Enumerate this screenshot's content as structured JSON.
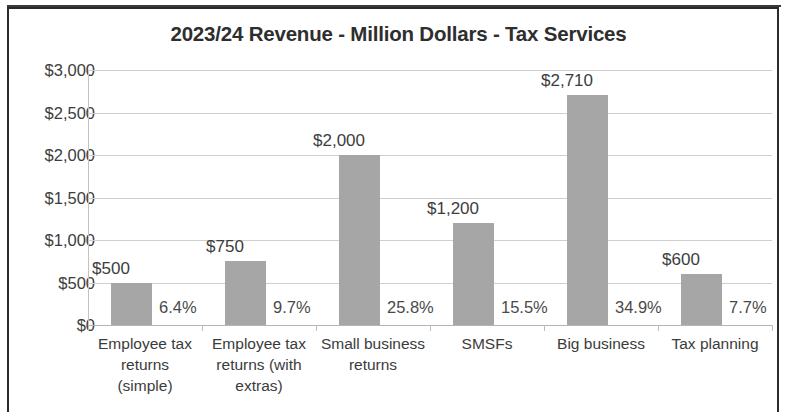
{
  "chart_data": {
    "type": "bar",
    "title": "2023/24 Revenue - Million Dollars - Tax Services",
    "xlabel": "",
    "ylabel": "",
    "ylim": [
      0,
      3000
    ],
    "ytick_labels": [
      "$3,000",
      "$2,500",
      "$2,000",
      "$1,500",
      "$1,000",
      "$500",
      "$0"
    ],
    "ytick_values": [
      3000,
      2500,
      2000,
      1500,
      1000,
      500,
      0
    ],
    "grid": true,
    "legend": "none",
    "bar_color": "#a6a6a6",
    "categories": [
      "Employee tax returns (simple)",
      "Employee tax returns (with extras)",
      "Small business returns",
      "SMSFs",
      "Big business",
      "Tax planning"
    ],
    "category_lines": [
      [
        "Employee tax",
        "returns",
        "(simple)"
      ],
      [
        "Employee tax",
        "returns (with",
        "extras)"
      ],
      [
        "Small business",
        "returns"
      ],
      [
        "SMSFs"
      ],
      [
        "Big business"
      ],
      [
        "Tax planning"
      ]
    ],
    "values": [
      500,
      750,
      2000,
      1200,
      2710,
      600
    ],
    "value_labels": [
      "$500",
      "$750",
      "$2,000",
      "$1,200",
      "$2,710",
      "$600"
    ],
    "percent_labels": [
      "6.4%",
      "9.7%",
      "25.8%",
      "15.5%",
      "34.9%",
      "7.7%"
    ],
    "percent_values": [
      6.4,
      9.7,
      25.8,
      15.5,
      34.9,
      7.7
    ]
  }
}
